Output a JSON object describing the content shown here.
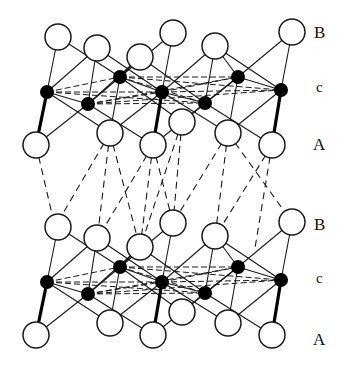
{
  "diagram": {
    "colors": {
      "line": "#1a1a1a",
      "open_atom_fill": "#ffffff",
      "filled_atom": "#000000",
      "background": "#ffffff"
    },
    "layer_labels": [
      {
        "text": "B",
        "x": 314,
        "y": 24
      },
      {
        "text": "c",
        "x": 316,
        "y": 80
      },
      {
        "text": "A",
        "x": 313,
        "y": 136
      },
      {
        "text": "B",
        "x": 314,
        "y": 216
      },
      {
        "text": "c",
        "x": 316,
        "y": 271
      },
      {
        "text": "A",
        "x": 313,
        "y": 331
      }
    ],
    "unit_offsets_y": [
      0,
      190
    ],
    "open_atom_radius": 13,
    "filled_atom_radius": 7,
    "B_atoms": [
      [
        58,
        37
      ],
      [
        97,
        48
      ],
      [
        140,
        57
      ],
      [
        173,
        33
      ],
      [
        215,
        46
      ],
      [
        292,
        32
      ]
    ],
    "c_atoms": [
      [
        47,
        92
      ],
      [
        88,
        104
      ],
      [
        120,
        77
      ],
      [
        162,
        92
      ],
      [
        205,
        103
      ],
      [
        238,
        77
      ],
      [
        281,
        90
      ]
    ],
    "A_atoms": [
      [
        36,
        145
      ],
      [
        110,
        133
      ],
      [
        153,
        145
      ],
      [
        182,
        122
      ],
      [
        228,
        133
      ],
      [
        272,
        145
      ]
    ],
    "solid_bonds": [
      [
        [
          58,
          37
        ],
        [
          47,
          92
        ]
      ],
      [
        [
          97,
          48
        ],
        [
          88,
          104
        ]
      ],
      [
        [
          140,
          57
        ],
        [
          120,
          77
        ]
      ],
      [
        [
          173,
          33
        ],
        [
          162,
          92
        ]
      ],
      [
        [
          215,
          46
        ],
        [
          205,
          103
        ]
      ],
      [
        [
          292,
          32
        ],
        [
          281,
          90
        ]
      ],
      [
        [
          173,
          33
        ],
        [
          120,
          77
        ]
      ],
      [
        [
          215,
          46
        ],
        [
          238,
          77
        ]
      ],
      [
        [
          58,
          37
        ],
        [
          120,
          77
        ]
      ],
      [
        [
          97,
          48
        ],
        [
          162,
          92
        ]
      ],
      [
        [
          140,
          57
        ],
        [
          205,
          103
        ]
      ],
      [
        [
          215,
          46
        ],
        [
          281,
          90
        ]
      ],
      [
        [
          97,
          48
        ],
        [
          47,
          92
        ]
      ],
      [
        [
          140,
          57
        ],
        [
          88,
          104
        ]
      ],
      [
        [
          215,
          46
        ],
        [
          162,
          92
        ]
      ],
      [
        [
          292,
          32
        ],
        [
          238,
          77
        ]
      ],
      [
        [
          47,
          92
        ],
        [
          110,
          133
        ]
      ],
      [
        [
          88,
          104
        ],
        [
          36,
          145
        ]
      ],
      [
        [
          88,
          104
        ],
        [
          153,
          145
        ]
      ],
      [
        [
          120,
          77
        ],
        [
          110,
          133
        ]
      ],
      [
        [
          120,
          77
        ],
        [
          182,
          122
        ]
      ],
      [
        [
          162,
          92
        ],
        [
          110,
          133
        ]
      ],
      [
        [
          162,
          92
        ],
        [
          228,
          133
        ]
      ],
      [
        [
          205,
          103
        ],
        [
          153,
          145
        ]
      ],
      [
        [
          205,
          103
        ],
        [
          272,
          145
        ]
      ],
      [
        [
          238,
          77
        ],
        [
          228,
          133
        ]
      ],
      [
        [
          238,
          77
        ],
        [
          182,
          122
        ]
      ],
      [
        [
          281,
          90
        ],
        [
          228,
          133
        ]
      ],
      [
        [
          47,
          92
        ],
        [
          88,
          104
        ]
      ],
      [
        [
          88,
          104
        ],
        [
          120,
          77
        ]
      ],
      [
        [
          162,
          92
        ],
        [
          205,
          103
        ]
      ],
      [
        [
          205,
          103
        ],
        [
          238,
          77
        ]
      ],
      [
        [
          120,
          77
        ],
        [
          162,
          92
        ]
      ],
      [
        [
          238,
          77
        ],
        [
          281,
          90
        ]
      ]
    ],
    "thick_bonds": [
      [
        [
          47,
          92
        ],
        [
          36,
          145
        ]
      ],
      [
        [
          162,
          92
        ],
        [
          153,
          145
        ]
      ],
      [
        [
          281,
          90
        ],
        [
          272,
          145
        ]
      ]
    ],
    "dashed_c_bonds": [
      [
        [
          47,
          92
        ],
        [
          120,
          77
        ]
      ],
      [
        [
          47,
          92
        ],
        [
          162,
          92
        ]
      ],
      [
        [
          47,
          92
        ],
        [
          205,
          103
        ]
      ],
      [
        [
          88,
          104
        ],
        [
          162,
          92
        ]
      ],
      [
        [
          88,
          104
        ],
        [
          238,
          77
        ]
      ],
      [
        [
          120,
          77
        ],
        [
          238,
          77
        ]
      ],
      [
        [
          120,
          77
        ],
        [
          281,
          90
        ]
      ],
      [
        [
          162,
          92
        ],
        [
          281,
          90
        ]
      ],
      [
        [
          88,
          104
        ],
        [
          205,
          103
        ]
      ],
      [
        [
          120,
          77
        ],
        [
          205,
          103
        ]
      ],
      [
        [
          162,
          92
        ],
        [
          238,
          77
        ]
      ],
      [
        [
          88,
          104
        ],
        [
          281,
          90
        ]
      ]
    ],
    "interlayer_dashed_bonds": [
      [
        [
          36,
          145
        ],
        [
          55,
          227
        ]
      ],
      [
        [
          110,
          133
        ],
        [
          55,
          227
        ]
      ],
      [
        [
          110,
          133
        ],
        [
          97,
          240
        ]
      ],
      [
        [
          110,
          133
        ],
        [
          140,
          248
        ]
      ],
      [
        [
          153,
          145
        ],
        [
          97,
          240
        ]
      ],
      [
        [
          153,
          145
        ],
        [
          140,
          248
        ]
      ],
      [
        [
          153,
          145
        ],
        [
          173,
          223
        ]
      ],
      [
        [
          182,
          122
        ],
        [
          173,
          223
        ]
      ],
      [
        [
          182,
          122
        ],
        [
          140,
          248
        ]
      ],
      [
        [
          228,
          133
        ],
        [
          173,
          223
        ]
      ],
      [
        [
          228,
          133
        ],
        [
          215,
          237
        ]
      ],
      [
        [
          228,
          133
        ],
        [
          292,
          222
        ]
      ],
      [
        [
          272,
          145
        ],
        [
          215,
          237
        ]
      ],
      [
        [
          272,
          145
        ],
        [
          255,
          248
        ]
      ]
    ]
  }
}
